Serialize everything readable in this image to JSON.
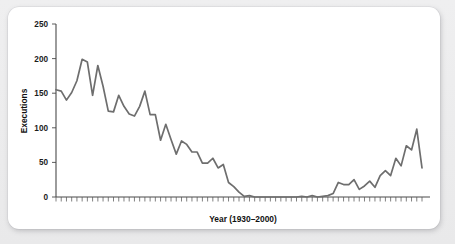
{
  "card": {
    "background": "#ffffff",
    "page_background": "#ececed"
  },
  "chart_data": {
    "type": "line",
    "title": "",
    "xlabel": "Year (1930–2000)",
    "ylabel": "Executions",
    "xlim": [
      1930,
      2000
    ],
    "ylim": [
      0,
      250
    ],
    "ytick_labels": [
      "0",
      "50",
      "100",
      "150",
      "200",
      "250"
    ],
    "yticks": [
      0,
      50,
      100,
      150,
      200,
      250
    ],
    "xtick_labels": [],
    "xtick_interval_years": 1,
    "grid": false,
    "legend": null,
    "line_color": "#6e6e6e",
    "axis_color": "#4a4a4a",
    "x": [
      1930,
      1931,
      1932,
      1933,
      1934,
      1935,
      1936,
      1937,
      1938,
      1939,
      1940,
      1941,
      1942,
      1943,
      1944,
      1945,
      1946,
      1947,
      1948,
      1949,
      1950,
      1951,
      1952,
      1953,
      1954,
      1955,
      1956,
      1957,
      1958,
      1959,
      1960,
      1961,
      1962,
      1963,
      1964,
      1965,
      1966,
      1967,
      1968,
      1969,
      1970,
      1971,
      1972,
      1973,
      1974,
      1975,
      1976,
      1977,
      1978,
      1979,
      1980,
      1981,
      1982,
      1983,
      1984,
      1985,
      1986,
      1987,
      1988,
      1989,
      1990,
      1991,
      1992,
      1993,
      1994,
      1995,
      1996,
      1997,
      1998,
      1999,
      2000
    ],
    "values": [
      155,
      153,
      140,
      151,
      168,
      199,
      195,
      147,
      190,
      160,
      124,
      123,
      147,
      131,
      120,
      117,
      131,
      153,
      119,
      119,
      82,
      105,
      83,
      62,
      81,
      76,
      65,
      65,
      49,
      49,
      56,
      42,
      47,
      21,
      15,
      7,
      1,
      2,
      0,
      0,
      0,
      0,
      0,
      0,
      0,
      0,
      0,
      1,
      0,
      2,
      0,
      1,
      2,
      5,
      21,
      18,
      18,
      25,
      11,
      16,
      23,
      14,
      31,
      38,
      31,
      56,
      45,
      74,
      68,
      98,
      42
    ],
    "annotations": []
  },
  "axis": {
    "y_label_text": "Executions",
    "x_label_text": "Year (1930–2000)"
  }
}
